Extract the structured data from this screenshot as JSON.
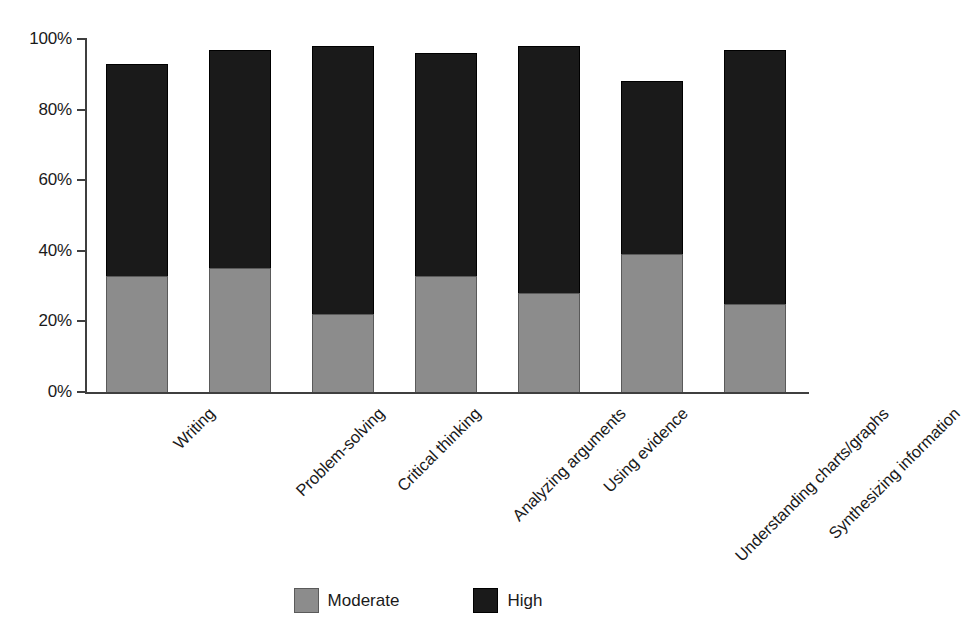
{
  "chart_data": {
    "type": "bar",
    "subtype": "stacked-bar",
    "title": "",
    "xlabel": "",
    "ylabel": "",
    "ylim": [
      0,
      100
    ],
    "y_tick_labels": [
      "0%",
      "20%",
      "40%",
      "60%",
      "80%",
      "100%"
    ],
    "y_tick_values": [
      0,
      20,
      40,
      60,
      80,
      100
    ],
    "grid": false,
    "legend_position": "bottom-center",
    "categories": [
      "Writing",
      "Problem-solving",
      "Critical thinking",
      "Analyzing arguments",
      "Using evidence",
      "Understanding charts/graphs",
      "Synthesizing information"
    ],
    "series": [
      {
        "name": "Moderate",
        "color": "#8c8c8c",
        "values": [
          33,
          35,
          22,
          33,
          28,
          39,
          25
        ]
      },
      {
        "name": "High",
        "color": "#1a1a1a",
        "values": [
          60,
          62,
          76,
          63,
          70,
          49,
          72
        ]
      }
    ],
    "cumulative_totals": [
      93,
      97,
      98,
      96,
      98,
      88,
      97
    ]
  },
  "legend": {
    "items": [
      {
        "label": "Moderate",
        "swatch": "moderate-swatch"
      },
      {
        "label": "High",
        "swatch": "high-swatch"
      }
    ]
  }
}
